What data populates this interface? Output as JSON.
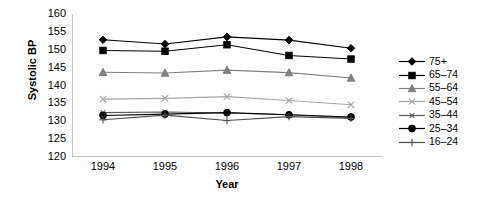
{
  "chart_data": {
    "type": "line",
    "title": "",
    "xlabel": "Year",
    "ylabel": "Systolic BP",
    "categories": [
      "1994",
      "1995",
      "1996",
      "1997",
      "1998"
    ],
    "ylim": [
      120,
      160
    ],
    "yticks": [
      120,
      125,
      130,
      135,
      140,
      145,
      150,
      155,
      160
    ],
    "grid": false,
    "legend_position": "right",
    "series": [
      {
        "name": "75+",
        "marker": "diamond",
        "color": "#000000",
        "values": [
          152.8,
          151.6,
          153.6,
          152.7,
          150.4
        ]
      },
      {
        "name": "65–74",
        "marker": "square",
        "color": "#000000",
        "values": [
          149.8,
          149.6,
          151.4,
          148.4,
          147.4
        ]
      },
      {
        "name": "55–64",
        "marker": "triangle",
        "color": "#808080",
        "values": [
          143.7,
          143.5,
          144.3,
          143.6,
          142.1
        ]
      },
      {
        "name": "45–54",
        "marker": "cross-x",
        "color": "#a6a6a6",
        "values": [
          136.2,
          136.4,
          136.9,
          135.8,
          134.6
        ]
      },
      {
        "name": "35–44",
        "marker": "asterisk",
        "color": "#5a5a5a",
        "values": [
          132.4,
          132.6,
          132.3,
          131.8,
          131.0
        ]
      },
      {
        "name": "25–34",
        "marker": "circle",
        "color": "#000000",
        "values": [
          131.6,
          132.0,
          132.4,
          131.8,
          131.2
        ]
      },
      {
        "name": "16–24",
        "marker": "plus",
        "color": "#4d4d4d",
        "values": [
          130.4,
          131.7,
          130.2,
          131.3,
          130.8
        ]
      }
    ]
  }
}
